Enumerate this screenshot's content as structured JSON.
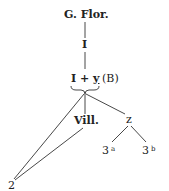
{
  "diagram": {
    "type": "stemma",
    "nodes": {
      "root": "G. Flor.",
      "i": "I",
      "iy_left": "I",
      "iy_plus": "+",
      "iy_right": "y",
      "iy_suffix": "(B)",
      "vill": "Vill.",
      "z": "z",
      "three_a_num": "3",
      "three_a_sup": "a",
      "three_b_num": "3",
      "three_b_sup": "b",
      "two": "2"
    },
    "edges": [
      [
        "G. Flor.",
        "I"
      ],
      [
        "I",
        "I + y (B)"
      ],
      [
        "I + y (B)",
        "Vill."
      ],
      [
        "I + y (B)",
        "z"
      ],
      [
        "I + y (B)",
        "2"
      ],
      [
        "Vill.",
        "2"
      ],
      [
        "z",
        "3a"
      ],
      [
        "z",
        "3b"
      ]
    ],
    "colors": {
      "ink": "#222222",
      "background": "#ffffff"
    }
  }
}
